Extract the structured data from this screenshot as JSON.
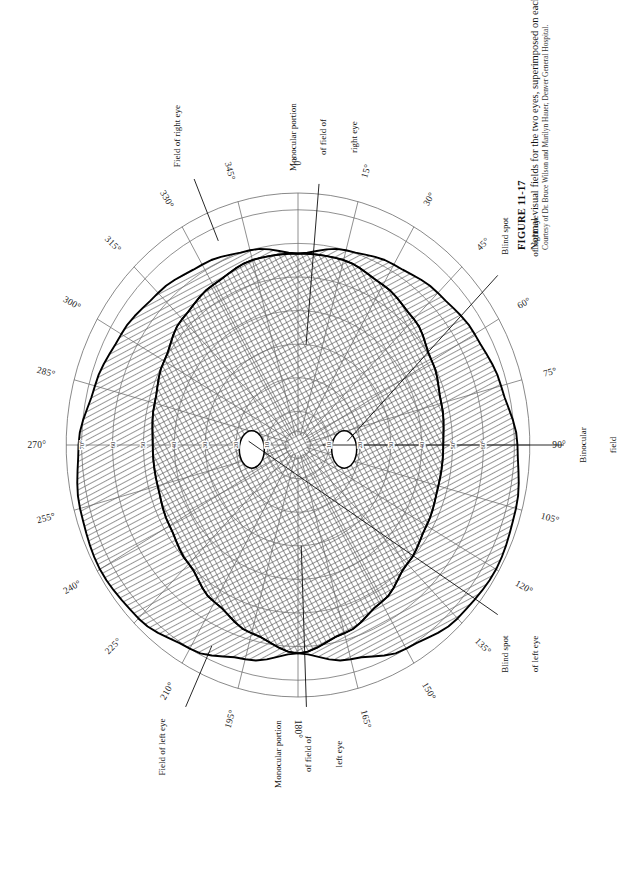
{
  "figure": {
    "number": "FIGURE 11-17",
    "title": "Normal visual fields for the two eyes, superimposed on each other.",
    "credit": "Courtesy of Dr. Bruce Wilson and Marilyn Hauer, Denver General Hospital."
  },
  "chart_data": {
    "type": "polar",
    "title": "Normal visual fields for the two eyes, superimposed on each other.",
    "orientation_note": "Plate is printed sideways; 0 degrees is at the top of the rotated plot, 90 degrees at the left, 180 degrees at the bottom, 270 degrees at the right.",
    "angle_unit": "degrees",
    "radial_unit": "degrees of eccentricity",
    "angle_labels": [
      "0°",
      "15°",
      "30°",
      "45°",
      "60°",
      "75°",
      "90°",
      "105°",
      "120°",
      "135°",
      "150°",
      "165°",
      "180°",
      "195°",
      "210°",
      "225°",
      "240°",
      "255°",
      "270°",
      "285°",
      "300°",
      "315°",
      "330°",
      "345°"
    ],
    "angle_values": [
      0,
      15,
      30,
      45,
      60,
      75,
      90,
      105,
      120,
      135,
      150,
      165,
      180,
      195,
      210,
      225,
      240,
      255,
      270,
      285,
      300,
      315,
      330,
      345
    ],
    "radial_ticks": [
      10,
      20,
      30,
      40,
      50,
      60,
      70
    ],
    "radial_labels_left": [
      "60°",
      "50°",
      "40",
      "30",
      "20",
      "10"
    ],
    "radial_labels_right": [
      "10",
      "20",
      "30",
      "40",
      "50",
      "60",
      "70°"
    ],
    "rlim": [
      0,
      75
    ],
    "grid": true,
    "legend_position": "none",
    "series": [
      {
        "name": "Field of right eye",
        "style": "heavy-outline",
        "angles": [
          0,
          15,
          30,
          45,
          60,
          75,
          90,
          105,
          120,
          135,
          150,
          165,
          180,
          195,
          210,
          225,
          240,
          255,
          270,
          285,
          300,
          315,
          330,
          345
        ],
        "values": [
          57,
          57,
          55,
          53,
          50,
          48,
          47,
          47,
          48,
          50,
          54,
          58,
          62,
          66,
          70,
          73,
          74,
          73,
          71,
          68,
          66,
          64,
          62,
          60
        ]
      },
      {
        "name": "Field of left eye",
        "style": "heavy-outline",
        "angles": [
          0,
          15,
          30,
          45,
          60,
          75,
          90,
          105,
          120,
          135,
          150,
          165,
          180,
          195,
          210,
          225,
          240,
          255,
          270,
          285,
          300,
          315,
          330,
          345
        ],
        "values": [
          57,
          60,
          62,
          64,
          66,
          68,
          71,
          73,
          74,
          73,
          70,
          66,
          62,
          58,
          54,
          50,
          48,
          47,
          47,
          48,
          50,
          53,
          55,
          57
        ]
      },
      {
        "name": "Binocular field",
        "style": "cross-hatch",
        "angles": [
          0,
          15,
          30,
          45,
          60,
          75,
          90,
          105,
          120,
          135,
          150,
          165,
          180,
          195,
          210,
          225,
          240,
          255,
          270,
          285,
          300,
          315,
          330,
          345
        ],
        "values": [
          57,
          57,
          55,
          53,
          50,
          48,
          47,
          47,
          48,
          50,
          54,
          58,
          62,
          58,
          54,
          50,
          48,
          47,
          47,
          48,
          50,
          53,
          55,
          57
        ]
      }
    ],
    "annotations": [
      {
        "label": "Monocular portion\nof field of\nright eye",
        "at_angle": 5,
        "at_radius": 62
      },
      {
        "label": "Field of right eye",
        "at_angle": 337,
        "at_radius": 74
      },
      {
        "label": "Blind spot\nof right eye",
        "at_angle": 48,
        "at_radius": 74
      },
      {
        "label": "Binocular\nfield",
        "at_angle": 90,
        "at_radius": 74
      },
      {
        "label": "Blind spot\nof left eye",
        "at_angle": 130,
        "at_radius": 74
      },
      {
        "label": "Monocular portion\nof field of\nleft eye",
        "at_angle": 178,
        "at_radius": 74
      },
      {
        "label": "Field of left eye",
        "at_angle": 205,
        "at_radius": 74
      }
    ],
    "blind_spots": [
      {
        "eye": "right",
        "center_angle": 95,
        "center_radius": 15,
        "width_deg": 6,
        "height_deg": 9
      },
      {
        "eye": "left",
        "center_angle": 265,
        "center_radius": 15,
        "width_deg": 6,
        "height_deg": 9
      }
    ]
  },
  "angles": {
    "a000": "0°",
    "a015": "15°",
    "a030": "30°",
    "a045": "45°",
    "a060": "60°",
    "a075": "75°",
    "a090": "90°",
    "a105": "105°",
    "a120": "120°",
    "a135": "135°",
    "a150": "150°",
    "a165": "165°",
    "a180": "180°",
    "a195": "195°",
    "a210": "210°",
    "a225": "225°",
    "a240": "240°",
    "a255": "255°",
    "a270": "270°",
    "a285": "285°",
    "a300": "300°",
    "a315": "315°",
    "a330": "330°",
    "a345": "345°"
  },
  "radial": {
    "l60": "60°",
    "l50": "50°",
    "l40": "40",
    "l30": "30",
    "l20": "20",
    "l10": "10",
    "r10": "10",
    "r20": "20",
    "r30": "30",
    "r40": "40",
    "r50": "50",
    "r60": "60",
    "r70": "70°"
  },
  "annotations": {
    "mono_right_l1": "Monocular portion",
    "mono_right_l2": "of field of",
    "mono_right_l3": "right eye",
    "field_right": "Field of right eye",
    "blind_right_l1": "Blind spot",
    "blind_right_l2": "of right eye",
    "binoc_l1": "Binocular",
    "binoc_l2": "field",
    "blind_left_l1": "Blind spot",
    "blind_left_l2": "of left eye",
    "mono_left_l1": "Monocular portion",
    "mono_left_l2": "of field of",
    "mono_left_l3": "left eye",
    "field_left": "Field of left eye"
  },
  "colors": {
    "ink": "#111111",
    "grid": "#6b6b6b",
    "heavy": "#000000",
    "paper": "#ffffff"
  }
}
